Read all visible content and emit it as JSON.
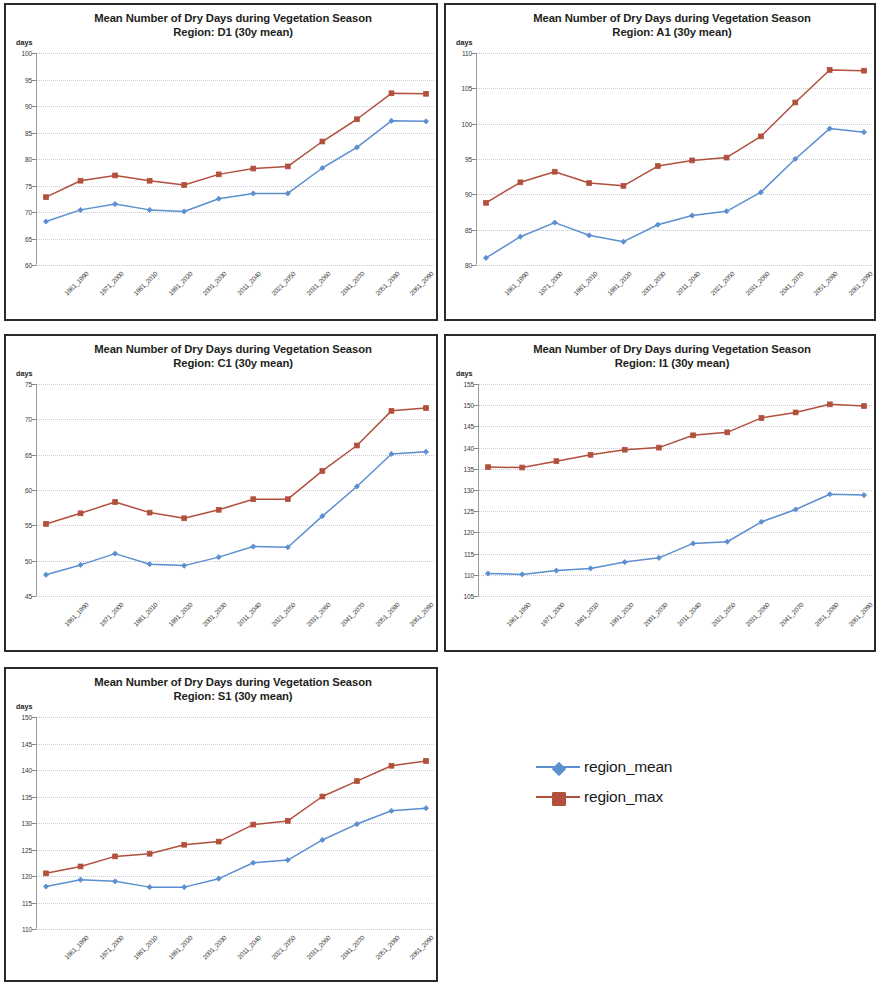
{
  "figure": {
    "title_line1": "Mean Number of Dry Days during Vegetation Season",
    "y_axis_label": "days",
    "legend": [
      {
        "label": "region_mean",
        "color": "#5b8fd0",
        "marker": "diamond"
      },
      {
        "label": "region_max",
        "color": "#b1503c",
        "marker": "square"
      }
    ]
  },
  "categories": [
    "1961_1990",
    "1971_2000",
    "1981_2010",
    "1991_2020",
    "2001_2030",
    "2011_2040",
    "2021_2050",
    "2031_2060",
    "2041_2070",
    "2051_2080",
    "2061_2090",
    "2071_2100"
  ],
  "chart_data": [
    {
      "type": "line",
      "panel": "D1",
      "title": "Mean Number of Dry Days during Vegetation Season",
      "subtitle": "Region:  D1  (30y mean)",
      "xlabel": "",
      "ylabel": "days",
      "ylim": [
        60,
        100
      ],
      "ytick_step": 5,
      "yticks": [
        60,
        65,
        70,
        75,
        80,
        85,
        90,
        95,
        100
      ],
      "grid": true,
      "legend_position": "external-right",
      "categories": [
        "1961_1990",
        "1971_2000",
        "1981_2010",
        "1991_2020",
        "2001_2030",
        "2011_2040",
        "2021_2050",
        "2031_2060",
        "2041_2070",
        "2051_2080",
        "2061_2090",
        "2071_2100"
      ],
      "series": [
        {
          "name": "region_mean",
          "color": "#5b8fd0",
          "values": [
            68.2,
            70.4,
            71.5,
            70.4,
            70.1,
            72.5,
            73.5,
            73.5,
            78.3,
            82.2,
            87.2,
            87.1
          ]
        },
        {
          "name": "region_max",
          "color": "#b1503c",
          "values": [
            72.8,
            75.9,
            76.9,
            75.9,
            75.1,
            77.1,
            78.2,
            78.6,
            83.3,
            87.5,
            92.4,
            92.3
          ]
        }
      ]
    },
    {
      "type": "line",
      "panel": "A1",
      "title": "Mean Number of Dry Days during Vegetation Season",
      "subtitle": "Region:  A1  (30y mean)",
      "xlabel": "",
      "ylabel": "days",
      "ylim": [
        80,
        110
      ],
      "ytick_step": 5,
      "yticks": [
        80,
        85,
        90,
        95,
        100,
        105,
        110
      ],
      "grid": true,
      "legend_position": "external-right",
      "categories": [
        "1961_1990",
        "1971_2000",
        "1981_2010",
        "1991_2020",
        "2001_2030",
        "2011_2040",
        "2021_2050",
        "2031_2060",
        "2041_2070",
        "2051_2080",
        "2061_2090",
        "2071_2100"
      ],
      "series": [
        {
          "name": "region_mean",
          "color": "#5b8fd0",
          "values": [
            81.0,
            84.0,
            86.0,
            84.2,
            83.3,
            85.7,
            87.0,
            87.6,
            90.3,
            95.0,
            99.3,
            98.8
          ]
        },
        {
          "name": "region_max",
          "color": "#b1503c",
          "values": [
            88.8,
            91.7,
            93.2,
            91.6,
            91.2,
            94.0,
            94.8,
            95.2,
            98.2,
            103.0,
            107.6,
            107.5
          ]
        }
      ]
    },
    {
      "type": "line",
      "panel": "C1",
      "title": "Mean Number of Dry Days during Vegetation Season",
      "subtitle": "Region:  C1  (30y mean)",
      "xlabel": "",
      "ylabel": "days",
      "ylim": [
        45,
        75
      ],
      "ytick_step": 5,
      "yticks": [
        45,
        50,
        55,
        60,
        65,
        70,
        75
      ],
      "grid": true,
      "legend_position": "external-right",
      "categories": [
        "1961_1990",
        "1971_2000",
        "1981_2010",
        "1991_2020",
        "2001_2030",
        "2011_2040",
        "2021_2050",
        "2031_2060",
        "2041_2070",
        "2051_2080",
        "2061_2090",
        "2071_2100"
      ],
      "series": [
        {
          "name": "region_mean",
          "color": "#5b8fd0",
          "values": [
            48.0,
            49.4,
            51.0,
            49.5,
            49.3,
            50.5,
            52.0,
            51.9,
            56.3,
            60.5,
            65.1,
            65.4
          ]
        },
        {
          "name": "region_max",
          "color": "#b1503c",
          "values": [
            55.2,
            56.7,
            58.3,
            56.8,
            56.0,
            57.2,
            58.7,
            58.7,
            62.7,
            66.3,
            71.2,
            71.6
          ]
        }
      ]
    },
    {
      "type": "line",
      "panel": "I1",
      "title": "Mean Number of Dry Days during Vegetation Season",
      "subtitle": "Region:  I1  (30y mean)",
      "xlabel": "",
      "ylabel": "days",
      "ylim": [
        105,
        155
      ],
      "ytick_step": 5,
      "yticks": [
        105,
        110,
        115,
        120,
        125,
        130,
        135,
        140,
        145,
        150,
        155
      ],
      "grid": true,
      "legend_position": "external-right",
      "categories": [
        "1961_1990",
        "1971_2000",
        "1981_2010",
        "1991_2020",
        "2001_2030",
        "2011_2040",
        "2021_2050",
        "2031_2060",
        "2041_2070",
        "2051_2080",
        "2061_2090",
        "2071_2100"
      ],
      "series": [
        {
          "name": "region_mean",
          "color": "#5b8fd0",
          "values": [
            110.3,
            110.1,
            111.0,
            111.5,
            113.0,
            114.0,
            117.4,
            117.8,
            122.5,
            125.4,
            129.0,
            128.8
          ]
        },
        {
          "name": "region_max",
          "color": "#b1503c",
          "values": [
            135.4,
            135.3,
            136.8,
            138.3,
            139.5,
            140.0,
            142.9,
            143.6,
            147.0,
            148.3,
            150.2,
            149.8
          ]
        }
      ]
    },
    {
      "type": "line",
      "panel": "S1",
      "title": "Mean Number of Dry Days during Vegetation Season",
      "subtitle": "Region:  S1  (30y mean)",
      "xlabel": "",
      "ylabel": "days",
      "ylim": [
        110,
        150
      ],
      "ytick_step": 5,
      "yticks": [
        110,
        115,
        120,
        125,
        130,
        135,
        140,
        145,
        150
      ],
      "grid": true,
      "legend_position": "external-right",
      "categories": [
        "1961_1990",
        "1971_2000",
        "1981_2010",
        "1991_2020",
        "2001_2030",
        "2011_2040",
        "2021_2050",
        "2031_2060",
        "2041_2070",
        "2051_2080",
        "2061_2090",
        "2071_2100"
      ],
      "series": [
        {
          "name": "region_mean",
          "color": "#5b8fd0",
          "values": [
            118.0,
            119.3,
            119.0,
            117.9,
            117.9,
            119.5,
            122.5,
            123.0,
            126.8,
            129.8,
            132.3,
            132.8
          ]
        },
        {
          "name": "region_max",
          "color": "#b1503c",
          "values": [
            120.5,
            121.8,
            123.7,
            124.2,
            125.9,
            126.5,
            129.7,
            130.4,
            135.0,
            137.9,
            140.8,
            141.7
          ]
        }
      ]
    }
  ]
}
